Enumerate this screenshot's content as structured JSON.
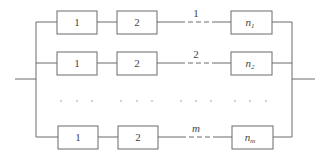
{
  "diagram": {
    "title": "",
    "type": "parallel-series system block diagram",
    "rows": [
      {
        "id": "row-1",
        "blocks": [
          "1",
          "2"
        ],
        "chain_label": "1",
        "last_block": {
          "base": "n",
          "sub": "1"
        }
      },
      {
        "id": "row-2",
        "blocks": [
          "1",
          "2"
        ],
        "chain_label": "2",
        "last_block": {
          "base": "n",
          "sub": "2"
        }
      },
      {
        "id": "row-m",
        "blocks": [
          "1",
          "2"
        ],
        "chain_label": "m",
        "last_block": {
          "base": "n",
          "sub": "m"
        }
      }
    ],
    "ellipsis": "· · ·",
    "colors": {
      "line": "#6a6a6a",
      "text": "#444444",
      "background": "#ffffff"
    }
  }
}
